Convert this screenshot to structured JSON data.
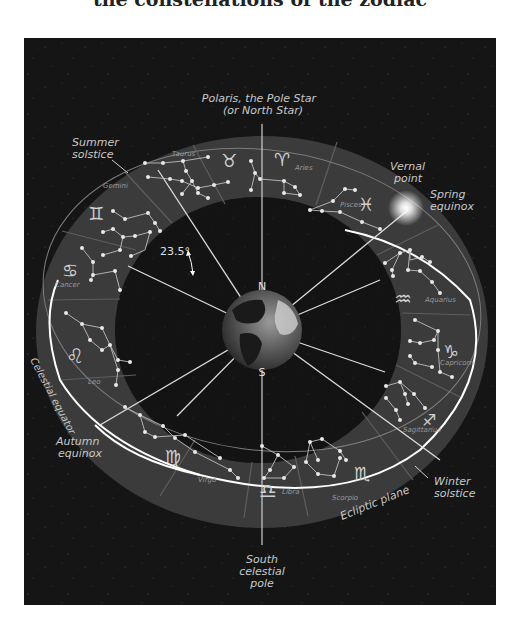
{
  "title": "the constellations of the zodiac",
  "labels": {
    "polaris_line1": "Polaris, the Pole Star",
    "polaris_line2": "(or North Star)",
    "summer_line1": "Summer",
    "summer_line2": "solstice",
    "vernal_line1": "Vernal",
    "vernal_line2": "point",
    "spring_line1": "Spring",
    "spring_line2": "equinox",
    "tilt_angle": "23.5°",
    "north": "N",
    "south": "S",
    "celestial_equator": "Celestial equator",
    "autumn_line1": "Autumn",
    "autumn_line2": "equinox",
    "winter_line1": "Winter",
    "winter_line2": "solstice",
    "ecliptic_plane": "Ecliptic plane",
    "south_pole_line1": "South",
    "south_pole_line2": "celestial",
    "south_pole_line3": "pole"
  },
  "constellations": [
    {
      "name": "Taurus",
      "symbol": "♉"
    },
    {
      "name": "Aries",
      "symbol": "♈"
    },
    {
      "name": "Pisces",
      "symbol": "♓"
    },
    {
      "name": "Aquarius",
      "symbol": "♒"
    },
    {
      "name": "Capricorn",
      "symbol": "♑"
    },
    {
      "name": "Sagittarius",
      "symbol": "♐"
    },
    {
      "name": "Scorpio",
      "symbol": "♏"
    },
    {
      "name": "Libra",
      "symbol": "♎"
    },
    {
      "name": "Virgo",
      "symbol": "♍"
    },
    {
      "name": "Leo",
      "symbol": "♌"
    },
    {
      "name": "Cancer",
      "symbol": "♋"
    },
    {
      "name": "Gemini",
      "symbol": "♊"
    }
  ],
  "colors": {
    "background": "#151515",
    "ring_band": "#3b3b3b",
    "inner_space": "#0f0f0f",
    "lines": "#d8d8d8",
    "text": "#c8c8c8"
  }
}
